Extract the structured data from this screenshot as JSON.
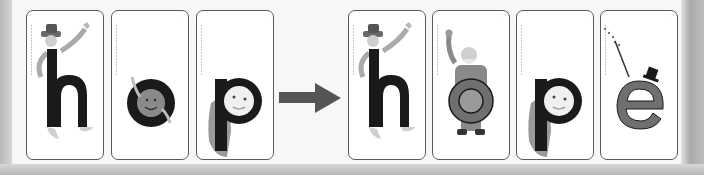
{
  "left_word": {
    "cards": [
      {
        "letter": "h",
        "character": "hairy hat man",
        "corner_label": "·"
      },
      {
        "letter": "o",
        "character": "orange ball",
        "corner_label": "·"
      },
      {
        "letter": "p",
        "character": "peter puppy",
        "corner_label": "·"
      }
    ]
  },
  "right_word": {
    "cards": [
      {
        "letter": "h",
        "character": "hairy hat man",
        "corner_label": "·"
      },
      {
        "letter": "o",
        "character": "old man",
        "corner_label": "·"
      },
      {
        "letter": "p",
        "character": "peter puppy",
        "corner_label": "·"
      },
      {
        "letter": "e",
        "character": "magic e",
        "corner_label": "·"
      }
    ]
  },
  "transition": {
    "icon": "right-arrow-icon"
  },
  "colors": {
    "letter_dark": "#1a1a1a",
    "letter_grey": "#6f6f6f",
    "card_border": "#5a5a5a",
    "arrow": "#555555"
  }
}
